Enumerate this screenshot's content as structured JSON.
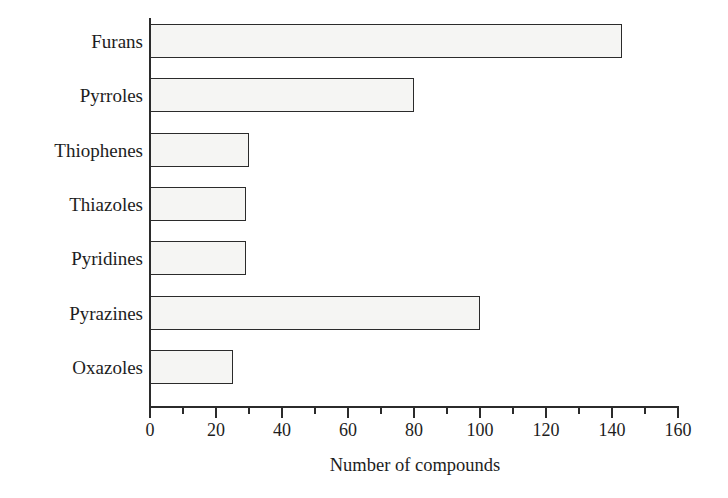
{
  "chart_data": {
    "type": "bar",
    "orientation": "horizontal",
    "title": "",
    "subtitle": "",
    "categories": [
      "Furans",
      "Pyrroles",
      "Thiophenes",
      "Thiazoles",
      "Pyridines",
      "Pyrazines",
      "Oxazoles"
    ],
    "values": [
      143,
      80,
      30,
      29,
      29,
      100,
      25
    ],
    "xlabel": "Number of compounds",
    "ylabel": "",
    "xlim": [
      0,
      160
    ],
    "xticks": [
      0,
      20,
      40,
      60,
      80,
      100,
      120,
      140,
      160
    ],
    "xtick_labels": [
      "0",
      "20",
      "40",
      "60",
      "80",
      "100",
      "120",
      "140",
      "160"
    ],
    "minor_xticks": [
      10,
      30,
      50,
      70,
      90,
      110,
      130,
      150
    ],
    "grid": false,
    "legend": null,
    "annotations": []
  },
  "style": {
    "bar_fill": "#f5f5f3",
    "bar_stroke": "#2b2b2b",
    "axis_color": "#2b2b2b",
    "text_color": "#1d1d1d",
    "background": "#ffffff"
  }
}
